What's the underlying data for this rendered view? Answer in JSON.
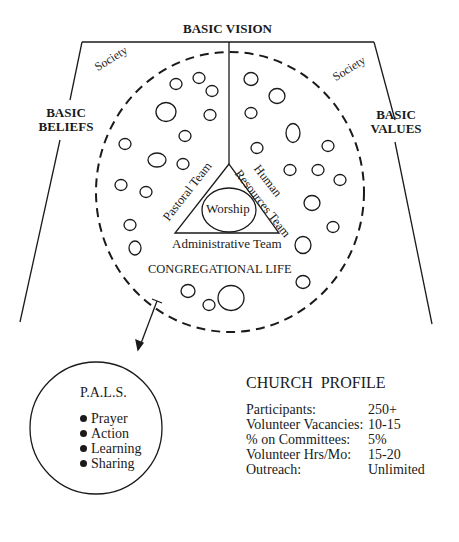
{
  "diagram": {
    "top_label": "BASIC VISION",
    "left_label_line1": "BASIC",
    "left_label_line2": "BELIEFS",
    "right_label_line1": "BASIC",
    "right_label_line2": "VALUES",
    "society_left": "Society",
    "society_right": "Society",
    "triangle": {
      "left_side": "Pastoral Team",
      "right_side_line1": "Human",
      "right_side_line2": "Resources Team",
      "base": "Administrative Team",
      "center": "Worship"
    },
    "circle_label": "CONGREGATIONAL LIFE"
  },
  "pals": {
    "title": "P.A.L.S.",
    "items": [
      "Prayer",
      "Action",
      "Learning",
      "Sharing"
    ]
  },
  "profile": {
    "title": "CHURCH  PROFILE",
    "rows": [
      {
        "label": "Participants:",
        "value": "250+"
      },
      {
        "label": "Volunteer Vacancies:",
        "value": "10-15"
      },
      {
        "label": "% on Committees:",
        "value": "5%"
      },
      {
        "label": "Volunteer Hrs/Mo:",
        "value": "15-20"
      },
      {
        "label": "Outreach:",
        "value": "Unlimited"
      }
    ]
  }
}
